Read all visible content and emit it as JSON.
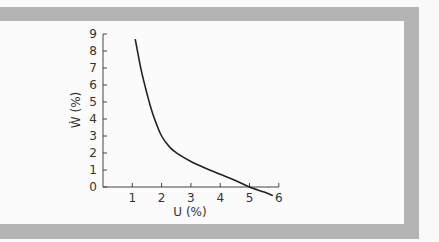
{
  "chart_data": {
    "type": "line",
    "title": "",
    "xlabel": "U (%)",
    "ylabel": "Ẇ (%)",
    "xlim": [
      0,
      6
    ],
    "ylim": [
      0,
      9
    ],
    "x_ticks": [
      "1",
      "2",
      "3",
      "4",
      "5",
      "6"
    ],
    "y_ticks": [
      "0",
      "1",
      "2",
      "3",
      "4",
      "5",
      "6",
      "7",
      "8",
      "9"
    ],
    "grid": false,
    "legend": null,
    "series": [
      {
        "name": "Phillips-type curve",
        "x": [
          1.1,
          1.3,
          1.5,
          1.7,
          2.0,
          2.3,
          2.6,
          3.0,
          3.5,
          4.0,
          4.5,
          5.0,
          5.5,
          5.8
        ],
        "y": [
          8.7,
          6.9,
          5.5,
          4.3,
          3.0,
          2.3,
          1.9,
          1.5,
          1.1,
          0.75,
          0.4,
          0.0,
          -0.3,
          -0.5
        ]
      }
    ],
    "colors": {
      "line": "#222222",
      "axis": "#444444",
      "frame": "#b4b4b4"
    }
  }
}
